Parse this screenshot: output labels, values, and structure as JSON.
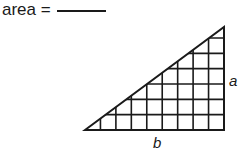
{
  "prompt": {
    "label": "area =",
    "answer": ""
  },
  "figure": {
    "shape": "right-triangle",
    "grid_columns": 9,
    "grid_rows": 7,
    "labels": {
      "height": "a",
      "base": "b"
    },
    "stroke_color": "#1a1a1a"
  }
}
